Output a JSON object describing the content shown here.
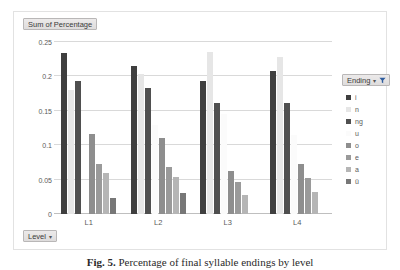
{
  "value_field": {
    "label": "Sum of Percentage"
  },
  "row_field": {
    "label": "Level",
    "caret": "▾"
  },
  "legend": {
    "title": "Ending",
    "caret": "▾",
    "filter_icon": "filter-icon",
    "items": [
      {
        "label": "i",
        "color": "#3f3f3f"
      },
      {
        "label": "n",
        "color": "#e6e6e6"
      },
      {
        "label": "ng",
        "color": "#4f4f4f"
      },
      {
        "label": "u",
        "color": "#fbfbfb"
      },
      {
        "label": "o",
        "color": "#8e8e8e"
      },
      {
        "label": "e",
        "color": "#9a9a9a"
      },
      {
        "label": "a",
        "color": "#b5b5b5"
      },
      {
        "label": "ü",
        "color": "#777777"
      }
    ]
  },
  "caption": {
    "label": "Fig. 5.",
    "text": "Percentage of final syllable endings by level"
  },
  "chart_data": {
    "type": "bar",
    "title": "Sum of Percentage",
    "xlabel": "Level",
    "ylabel": "",
    "categories": [
      "L1",
      "L2",
      "L3",
      "L4"
    ],
    "ylim": [
      0,
      0.25
    ],
    "yticks": [
      0,
      0.05,
      0.1,
      0.15,
      0.2,
      0.25
    ],
    "ytick_labels": [
      "0",
      "0.05",
      "0.1",
      "0.15",
      "0.2",
      "0.25"
    ],
    "grid": true,
    "legend_position": "right",
    "legend_title": "Ending",
    "series": [
      {
        "name": "i",
        "color": "#3f3f3f",
        "values": [
          0.234,
          0.215,
          0.193,
          0.208
        ]
      },
      {
        "name": "n",
        "color": "#e6e6e6",
        "values": [
          0.18,
          0.204,
          0.235,
          0.228
        ]
      },
      {
        "name": "ng",
        "color": "#4f4f4f",
        "values": [
          0.193,
          0.183,
          0.162,
          0.161
        ]
      },
      {
        "name": "u",
        "color": "#fbfbfb",
        "values": [
          0.0,
          0.13,
          0.146,
          0.115
        ]
      },
      {
        "name": "o",
        "color": "#8e8e8e",
        "values": [
          0.116,
          0.11,
          0.062,
          0.072
        ]
      },
      {
        "name": "e",
        "color": "#9a9a9a",
        "values": [
          0.073,
          0.068,
          0.047,
          0.053
        ]
      },
      {
        "name": "a",
        "color": "#b5b5b5",
        "values": [
          0.059,
          0.054,
          0.028,
          0.032
        ]
      },
      {
        "name": "ü",
        "color": "#777777",
        "values": [
          0.023,
          0.03,
          0.0,
          0.0
        ]
      }
    ]
  }
}
